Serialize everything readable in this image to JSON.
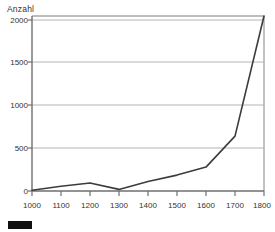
{
  "chart_data": {
    "type": "line",
    "title": "",
    "subtitle": "",
    "xlabel": "",
    "ylabel": "Anzahl",
    "x": [
      1000,
      1100,
      1200,
      1300,
      1400,
      1500,
      1600,
      1700,
      1800
    ],
    "values": [
      10,
      60,
      100,
      20,
      120,
      200,
      300,
      690,
      2200
    ],
    "series": [
      {
        "name": "Anzahl",
        "color": "#3c3c3c",
        "values": [
          10,
          60,
          100,
          20,
          120,
          200,
          300,
          690,
          2200
        ]
      }
    ],
    "xlim": [
      1000,
      1800
    ],
    "ylim": [
      0,
      2200
    ],
    "xticks": [
      1000,
      1100,
      1200,
      1300,
      1400,
      1500,
      1600,
      1700,
      1800
    ],
    "xtick_labels": [
      "1000",
      "1100",
      "1200",
      "1300",
      "1400",
      "1500",
      "1600",
      "1700",
      "1800"
    ],
    "yticks": [
      0,
      500,
      1000,
      1500,
      2000
    ],
    "ytick_labels": [
      "0",
      "500",
      "1000",
      "1500",
      "2000"
    ],
    "grid": "horizontal",
    "grid_color": "#b4b4b4",
    "axis_color": "#9a9a9a",
    "legend_position": "below-left",
    "legend": [
      {
        "label": "",
        "color": "#111111"
      }
    ]
  }
}
